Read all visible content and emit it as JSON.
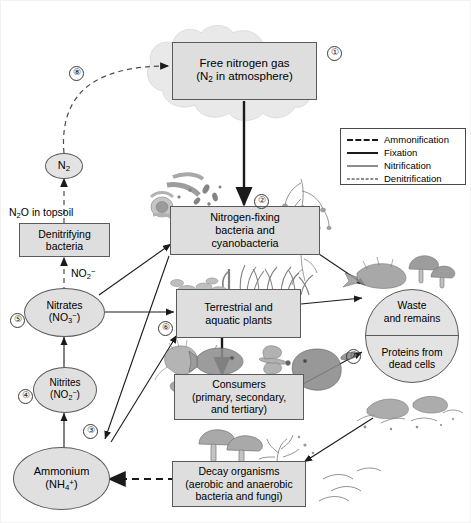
{
  "diagram": {
    "background": "#ffffff",
    "node_fill": "#dedede",
    "node_stroke": "#5a5a5a",
    "cloud_fill": "#e6e6e6"
  },
  "nodes": {
    "free_nitrogen": {
      "line1": "Free nitrogen gas",
      "line2_pre": "(N",
      "line2_sub": "2",
      "line2_post": " in atmosphere)",
      "marker": "①"
    },
    "n2_circle": {
      "pre": "N",
      "sub": "2"
    },
    "n2o_topsoil": {
      "pre": "N",
      "sub": "2",
      "post": "O in topsoil"
    },
    "denitrifying": {
      "line1": "Denitrifying",
      "line2": "bacteria"
    },
    "no2_label": {
      "pre": "NO",
      "sub": "2",
      "sup": "−"
    },
    "nitrates": {
      "line1": "Nitrates",
      "line2_pre": "(NO",
      "line2_sub": "3",
      "line2_sup": "−",
      "line2_post": ")",
      "marker": "⑤"
    },
    "nitrites": {
      "line1": "Nitrites",
      "line2_pre": "(NO",
      "line2_sub": "2",
      "line2_sup": "−",
      "line2_post": ")",
      "marker": "④"
    },
    "ammonium": {
      "line1": "Ammonium",
      "line2_pre": "(NH",
      "line2_sub": "4",
      "line2_sup": "+",
      "line2_post": ")",
      "marker": "③"
    },
    "nitrogen_fixing": {
      "line1": "Nitrogen-fixing",
      "line2": "bacteria and",
      "line3": "cyanobacteria",
      "marker": "②"
    },
    "plants": {
      "line1": "Terrestrial and",
      "line2": "aquatic plants",
      "marker": "⑥"
    },
    "consumers": {
      "line1": "Consumers",
      "line2": "(primary, secondary,",
      "line3": "and tertiary)"
    },
    "decay": {
      "line1": "Decay organisms",
      "line2": "(aerobic and anaerobic",
      "line3": "bacteria and fungi)"
    },
    "waste": {
      "line1": "Waste",
      "line2": "and remains",
      "line3": "Proteins from",
      "line4": "dead cells",
      "marker": "⑦"
    },
    "denitrification_marker": {
      "marker": "⑧"
    }
  },
  "legend": {
    "items": [
      {
        "label": "Ammonification",
        "style": "dash-thick"
      },
      {
        "label": "Fixation",
        "style": "solid-thick"
      },
      {
        "label": "Nitrification",
        "style": "solid-thin"
      },
      {
        "label": "Denitrification",
        "style": "dash-thin"
      }
    ]
  }
}
